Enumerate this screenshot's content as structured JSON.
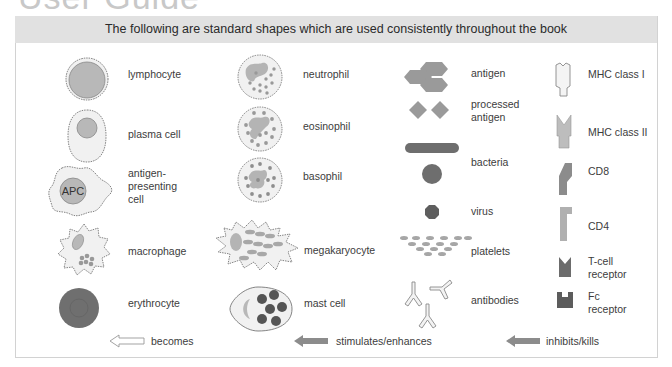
{
  "page": {
    "title_partial": "User Guide",
    "banner": "The following are standard shapes which are used consistently throughout the book"
  },
  "columns": [
    {
      "items": [
        {
          "label": "lymphocyte",
          "icon": "lymphocyte-icon"
        },
        {
          "label": "plasma cell",
          "icon": "plasma-cell-icon"
        },
        {
          "label": "antigen-\npresenting\ncell",
          "icon": "apc-icon",
          "inner_text": "APC"
        },
        {
          "label": "macrophage",
          "icon": "macrophage-icon"
        },
        {
          "label": "erythrocyte",
          "icon": "erythrocyte-icon"
        }
      ]
    },
    {
      "items": [
        {
          "label": "neutrophil",
          "icon": "neutrophil-icon"
        },
        {
          "label": "eosinophil",
          "icon": "eosinophil-icon"
        },
        {
          "label": "basophil",
          "icon": "basophil-icon"
        },
        {
          "label": "megakaryocyte",
          "icon": "megakaryocyte-icon"
        },
        {
          "label": "mast cell",
          "icon": "mast-cell-icon"
        }
      ]
    },
    {
      "items": [
        {
          "label": "antigen",
          "icon": "antigen-icon"
        },
        {
          "label": "processed\nantigen",
          "icon": "processed-antigen-icon"
        },
        {
          "label": "bacteria",
          "icon": "bacteria-icon"
        },
        {
          "label": "virus",
          "icon": "virus-icon"
        },
        {
          "label": "platelets",
          "icon": "platelets-icon"
        },
        {
          "label": "antibodies",
          "icon": "antibodies-icon"
        }
      ]
    },
    {
      "items": [
        {
          "label": "MHC class I",
          "icon": "mhc-class-1-icon"
        },
        {
          "label": "MHC class II",
          "icon": "mhc-class-2-icon"
        },
        {
          "label": "CD8",
          "icon": "cd8-icon"
        },
        {
          "label": "CD4",
          "icon": "cd4-icon"
        },
        {
          "label": "T-cell\nreceptor",
          "icon": "t-cell-receptor-icon"
        },
        {
          "label": "Fc\nreceptor",
          "icon": "fc-receptor-icon"
        }
      ]
    }
  ],
  "arrows": [
    {
      "label": "becomes",
      "style": "outline"
    },
    {
      "label": "stimulates/enhances",
      "style": "filled"
    },
    {
      "label": "inhibits/kills",
      "style": "filled"
    }
  ],
  "colors": {
    "banner_bg": "#e1e1e1",
    "cell_fill": "#f1f1f1",
    "nucleus": "#b4b4b4",
    "dark": "#6e6e6e",
    "arrow": "#8c8c8c"
  }
}
